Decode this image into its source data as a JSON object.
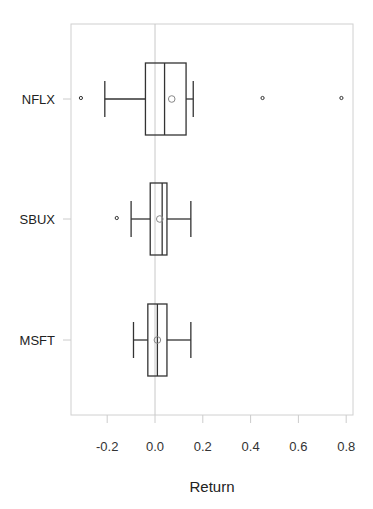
{
  "chart_data": {
    "type": "boxplot",
    "orientation": "horizontal",
    "title": "",
    "xlabel": "Return",
    "ylabel": "",
    "xlim": [
      -0.34,
      0.83
    ],
    "x_ticks": [
      -0.2,
      0.0,
      0.2,
      0.4,
      0.6,
      0.8
    ],
    "x_tick_labels": [
      "-0.2",
      "0.0",
      "0.2",
      "0.4",
      "0.6",
      "0.8"
    ],
    "reference_line_x": 0.0,
    "grid": false,
    "legend": null,
    "categories": [
      "NFLX",
      "SBUX",
      "MSFT"
    ],
    "series": [
      {
        "name": "NFLX",
        "whisker_low": -0.21,
        "q1": -0.04,
        "median": 0.04,
        "q3": 0.13,
        "whisker_high": 0.16,
        "mean": 0.07,
        "outliers": [
          -0.31,
          0.45,
          0.78
        ]
      },
      {
        "name": "SBUX",
        "whisker_low": -0.1,
        "q1": -0.02,
        "median": 0.03,
        "q3": 0.05,
        "whisker_high": 0.15,
        "mean": 0.02,
        "outliers": [
          -0.16
        ]
      },
      {
        "name": "MSFT",
        "whisker_low": -0.09,
        "q1": -0.03,
        "median": 0.01,
        "q3": 0.05,
        "whisker_high": 0.15,
        "mean": 0.01,
        "outliers": []
      }
    ]
  },
  "colors": {
    "box": "#333333",
    "frame": "#cccccc",
    "refline": "#c8c8c8",
    "mean": "#888888"
  }
}
